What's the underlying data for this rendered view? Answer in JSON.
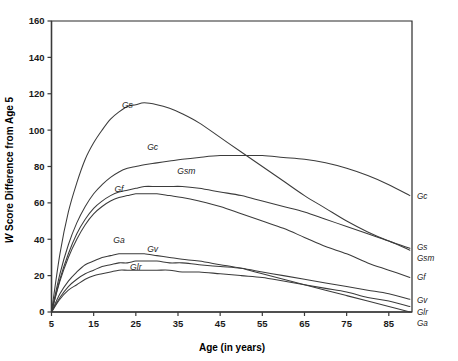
{
  "chart_data": {
    "type": "line",
    "title": "",
    "xlabel": "Age (in years)",
    "ylabel": "W Score Difference from Age 5",
    "ylabel_italic_prefix": "W",
    "ylabel_rest": " Score Difference from Age 5",
    "xlim": [
      5,
      90.5
    ],
    "ylim": [
      0,
      160
    ],
    "xticks": [
      5,
      15,
      25,
      35,
      45,
      55,
      65,
      75,
      85
    ],
    "yticks": [
      0,
      20,
      40,
      60,
      80,
      100,
      120,
      140,
      160
    ],
    "grid": false,
    "legend": "right-edge-labels",
    "x": [
      5,
      7,
      9,
      11,
      13,
      15,
      17,
      19,
      21,
      23,
      25,
      27,
      30,
      33,
      36,
      40,
      45,
      50,
      55,
      60,
      65,
      70,
      75,
      80,
      85,
      90
    ],
    "series": [
      {
        "name": "Gs",
        "label": "Gs",
        "inline_label": "Gs",
        "inline_label_x": 23,
        "inline_label_y": 112,
        "edge_label": "Gs",
        "values": [
          0,
          32,
          55,
          71,
          84,
          93,
          100,
          106,
          110,
          113,
          114,
          115,
          114,
          112,
          109,
          104,
          96,
          88,
          80,
          72,
          64,
          57,
          50,
          44,
          39,
          35
        ]
      },
      {
        "name": "Gc",
        "label": "Gc",
        "inline_label": "Gc",
        "inline_label_x": 29,
        "inline_label_y": 89,
        "edge_label": "Gc",
        "values": [
          0,
          21,
          37,
          49,
          58,
          65,
          70,
          74,
          77,
          79,
          80,
          81,
          82,
          83,
          84,
          85,
          86,
          86,
          86,
          85,
          84,
          82,
          79,
          75,
          70,
          64
        ]
      },
      {
        "name": "Gsm",
        "label": "Gsm",
        "inline_label": "Gsm",
        "inline_label_x": 37,
        "inline_label_y": 76,
        "edge_label": "Gsm",
        "values": [
          0,
          18,
          32,
          43,
          51,
          57,
          61,
          64,
          66,
          67,
          68,
          69,
          69,
          69,
          69,
          68,
          66,
          64,
          61,
          58,
          55,
          51,
          47,
          43,
          39,
          34
        ]
      },
      {
        "name": "Gf",
        "label": "Gf",
        "inline_label": "Gf",
        "inline_label_x": 21,
        "inline_label_y": 66,
        "edge_label": "Gf",
        "values": [
          0,
          17,
          30,
          40,
          48,
          54,
          58,
          61,
          63,
          64,
          65,
          65,
          65,
          64,
          63,
          61,
          58,
          54,
          50,
          46,
          41,
          36,
          32,
          27,
          23,
          19
        ]
      },
      {
        "name": "Ga",
        "label": "Ga",
        "inline_label": "Ga",
        "inline_label_x": 21,
        "inline_label_y": 38,
        "edge_label": "Ga",
        "values": [
          0,
          10,
          17,
          22,
          26,
          28,
          30,
          31,
          32,
          32,
          32,
          32,
          31,
          30,
          29,
          28,
          26,
          24,
          21,
          18,
          15,
          12,
          9,
          6,
          3,
          0
        ]
      },
      {
        "name": "Gv",
        "label": "Gv",
        "inline_label": "Gv",
        "inline_label_x": 29,
        "inline_label_y": 33,
        "edge_label": "Gv",
        "values": [
          0,
          8,
          14,
          18,
          21,
          23,
          25,
          26,
          27,
          27,
          28,
          28,
          28,
          27,
          27,
          26,
          25,
          24,
          22,
          20,
          18,
          16,
          14,
          12,
          10,
          7
        ]
      },
      {
        "name": "Glr",
        "label": "Glr",
        "inline_label": "Glr",
        "inline_label_x": 25,
        "inline_label_y": 23,
        "edge_label": "Glr",
        "values": [
          0,
          7,
          12,
          15,
          18,
          20,
          21,
          22,
          23,
          23,
          23,
          23,
          23,
          23,
          22,
          22,
          21,
          20,
          19,
          17,
          15,
          13,
          11,
          8,
          6,
          3
        ]
      }
    ]
  }
}
